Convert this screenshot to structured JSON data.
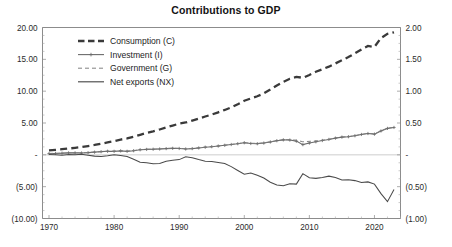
{
  "chart_data": {
    "type": "line",
    "title": "Contributions to GDP",
    "xlabel": "",
    "ylabel": "",
    "grid": false,
    "legend_position": "upper-left",
    "x": [
      1970,
      1971,
      1972,
      1973,
      1974,
      1975,
      1976,
      1977,
      1978,
      1979,
      1980,
      1981,
      1982,
      1983,
      1984,
      1985,
      1986,
      1987,
      1988,
      1989,
      1990,
      1991,
      1992,
      1993,
      1994,
      1995,
      1996,
      1997,
      1998,
      1999,
      2000,
      2001,
      2002,
      2003,
      2004,
      2005,
      2006,
      2007,
      2008,
      2009,
      2010,
      2011,
      2012,
      2013,
      2014,
      2015,
      2016,
      2017,
      2018,
      2019,
      2020,
      2021,
      2022,
      2023
    ],
    "xlim": [
      1969,
      2024
    ],
    "xticks": [
      1970,
      1980,
      1990,
      2000,
      2010,
      2020
    ],
    "xtick_labels": [
      "1970",
      "1980",
      "1990",
      "2000",
      "2010",
      "2020"
    ],
    "left_axis": {
      "ylim": [
        -10.0,
        20.0
      ],
      "yticks": [
        -10.0,
        -5.0,
        0.0,
        5.0,
        10.0,
        15.0,
        20.0
      ],
      "ytick_labels": [
        "(10.00)",
        "(5.00)",
        "-",
        "5.00",
        "10.00",
        "15.00",
        "20.00"
      ]
    },
    "right_axis": {
      "ylim": [
        -1.0,
        2.0
      ],
      "yticks": [
        -1.0,
        -0.5,
        0.0,
        0.5,
        1.0,
        1.5,
        2.0
      ],
      "ytick_labels": [
        "(1.00)",
        "(0.50)",
        "-",
        "0.50",
        "1.00",
        "1.50",
        "2.00"
      ]
    },
    "series": [
      {
        "name": "Consumption (C)",
        "legend_key": "consumption",
        "axis": "left",
        "style": "thick-dashed",
        "values": [
          0.7,
          0.78,
          0.88,
          0.99,
          1.1,
          1.22,
          1.38,
          1.55,
          1.75,
          1.95,
          2.15,
          2.4,
          2.58,
          2.85,
          3.15,
          3.45,
          3.7,
          3.98,
          4.3,
          4.6,
          4.9,
          5.08,
          5.38,
          5.68,
          6.02,
          6.32,
          6.68,
          7.05,
          7.45,
          7.95,
          8.5,
          8.85,
          9.2,
          9.65,
          10.25,
          10.9,
          11.45,
          11.95,
          12.25,
          12.1,
          12.55,
          13.05,
          13.45,
          13.85,
          14.35,
          14.85,
          15.35,
          15.95,
          16.55,
          17.1,
          16.95,
          18.35,
          19.0,
          19.25
        ]
      },
      {
        "name": "Investment (I)",
        "legend_key": "investment",
        "axis": "left",
        "style": "line-with-markers",
        "values": [
          0.2,
          0.22,
          0.26,
          0.3,
          0.3,
          0.28,
          0.34,
          0.42,
          0.5,
          0.56,
          0.55,
          0.62,
          0.55,
          0.65,
          0.8,
          0.85,
          0.88,
          0.92,
          0.98,
          1.02,
          1.0,
          0.92,
          0.98,
          1.08,
          1.2,
          1.28,
          1.38,
          1.5,
          1.62,
          1.75,
          1.9,
          1.78,
          1.75,
          1.85,
          2.02,
          2.22,
          2.35,
          2.32,
          2.15,
          1.6,
          1.85,
          2.05,
          2.25,
          2.42,
          2.62,
          2.78,
          2.85,
          3.0,
          3.2,
          3.35,
          3.25,
          3.75,
          4.15,
          4.3
        ]
      },
      {
        "name": "Government (G)",
        "legend_key": "government",
        "axis": "left",
        "style": "thin-dashed",
        "values": [
          0.22,
          0.24,
          0.28,
          0.31,
          0.32,
          0.31,
          0.36,
          0.44,
          0.51,
          0.57,
          0.57,
          0.64,
          0.58,
          0.67,
          0.81,
          0.87,
          0.9,
          0.94,
          1.0,
          1.04,
          1.03,
          0.96,
          1.0,
          1.1,
          1.21,
          1.29,
          1.39,
          1.51,
          1.63,
          1.76,
          1.91,
          1.82,
          1.8,
          1.89,
          2.05,
          2.24,
          2.37,
          2.38,
          2.3,
          2.05,
          2.12,
          2.18,
          2.3,
          2.45,
          2.64,
          2.8,
          2.87,
          3.02,
          3.22,
          3.37,
          3.3,
          3.78,
          4.18,
          4.32
        ]
      },
      {
        "name": "Net exports (NX)",
        "legend_key": "netexports",
        "axis": "left",
        "style": "solid",
        "values": [
          0.05,
          0.02,
          -0.05,
          0.05,
          0.0,
          0.08,
          -0.05,
          -0.2,
          -0.25,
          -0.15,
          0.0,
          -0.1,
          -0.25,
          -0.7,
          -1.15,
          -1.25,
          -1.4,
          -1.35,
          -1.0,
          -0.85,
          -0.75,
          -0.3,
          -0.45,
          -0.75,
          -1.0,
          -1.05,
          -1.2,
          -1.35,
          -1.85,
          -2.45,
          -3.05,
          -2.85,
          -3.2,
          -3.65,
          -4.3,
          -4.75,
          -4.85,
          -4.55,
          -4.6,
          -2.95,
          -3.6,
          -3.7,
          -3.55,
          -3.35,
          -3.55,
          -3.95,
          -3.9,
          -4.05,
          -4.35,
          -4.25,
          -4.6,
          -6.1,
          -7.35,
          -5.45
        ]
      }
    ]
  },
  "legend": {
    "items": [
      {
        "key": "consumption",
        "label": "Consumption (C)"
      },
      {
        "key": "investment",
        "label": "Investment (I)"
      },
      {
        "key": "government",
        "label": "Government (G)"
      },
      {
        "key": "netexports",
        "label": "Net exports (NX)"
      }
    ]
  }
}
